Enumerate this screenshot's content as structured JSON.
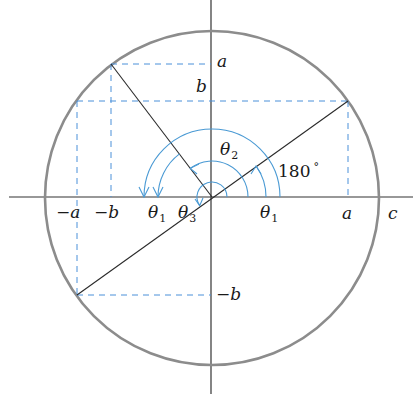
{
  "figure": {
    "type": "unit-circle-angle-diagram",
    "colors": {
      "circle": "#8c8c8c",
      "axis": "#333333",
      "line": "#2a2a2a",
      "dashed": "#4a90d9",
      "arc": "#4a9ad4",
      "text": "#1a1a1a"
    },
    "center": [
      212,
      197
    ],
    "radius": 167,
    "points": {
      "P": [
        348,
        101
      ],
      "P_opposite": [
        77,
        295
      ],
      "Q": [
        111,
        64
      ]
    },
    "angles_deg": {
      "line_PO": 35.2,
      "line_QO": 127.2
    },
    "arcs": [
      {
        "name": "180-degree-arc",
        "radius": 68,
        "from": 0,
        "to": 180
      },
      {
        "name": "theta1-right-arc",
        "radius": 54,
        "from": 0,
        "to": 35
      },
      {
        "name": "theta1-left-arc",
        "radius": 54,
        "from": 127,
        "to": 180
      },
      {
        "name": "theta2-arc",
        "radius": 36,
        "from": 0,
        "to": 127
      },
      {
        "name": "theta3-arc",
        "radius": 15,
        "from": 0,
        "to": 215
      }
    ]
  },
  "labels": {
    "y_a": "a",
    "y_b": "b",
    "y_neg_b": "−b",
    "x_neg_a": "−a",
    "x_neg_b": "−b",
    "x_a": "a",
    "x_c": "c",
    "theta": "θ",
    "theta1_left_sub": "1",
    "theta3_sub": "3",
    "theta1_right_sub": "1",
    "theta2_sub": "2",
    "deg180": "180",
    "deg_symbol": "°"
  }
}
